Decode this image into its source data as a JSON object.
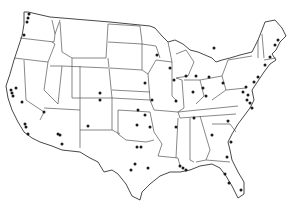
{
  "map": {
    "title": "Contiguous United States locations map",
    "width": 296,
    "height": 209,
    "colors": {
      "background": "#ffffff",
      "border": "#555555",
      "coast": "#333333",
      "dot": "#1a1a1a"
    },
    "dot_radius": 1.5,
    "points": [
      {
        "x": 29,
        "y": 14
      },
      {
        "x": 28,
        "y": 18
      },
      {
        "x": 27,
        "y": 22
      },
      {
        "x": 24,
        "y": 35
      },
      {
        "x": 16,
        "y": 88
      },
      {
        "x": 11,
        "y": 90
      },
      {
        "x": 12,
        "y": 93
      },
      {
        "x": 13,
        "y": 96
      },
      {
        "x": 22,
        "y": 102
      },
      {
        "x": 44,
        "y": 112
      },
      {
        "x": 25,
        "y": 124
      },
      {
        "x": 26,
        "y": 127
      },
      {
        "x": 28,
        "y": 134
      },
      {
        "x": 58,
        "y": 134
      },
      {
        "x": 60,
        "y": 135
      },
      {
        "x": 62,
        "y": 144
      },
      {
        "x": 88,
        "y": 126
      },
      {
        "x": 100,
        "y": 93
      },
      {
        "x": 100,
        "y": 100
      },
      {
        "x": 145,
        "y": 83
      },
      {
        "x": 152,
        "y": 100
      },
      {
        "x": 138,
        "y": 110
      },
      {
        "x": 145,
        "y": 115
      },
      {
        "x": 137,
        "y": 125
      },
      {
        "x": 137,
        "y": 147
      },
      {
        "x": 141,
        "y": 147
      },
      {
        "x": 135,
        "y": 164
      },
      {
        "x": 131,
        "y": 170
      },
      {
        "x": 148,
        "y": 168
      },
      {
        "x": 157,
        "y": 55
      },
      {
        "x": 170,
        "y": 68
      },
      {
        "x": 174,
        "y": 80
      },
      {
        "x": 150,
        "y": 127
      },
      {
        "x": 176,
        "y": 101
      },
      {
        "x": 186,
        "y": 76
      },
      {
        "x": 196,
        "y": 76
      },
      {
        "x": 209,
        "y": 77
      },
      {
        "x": 193,
        "y": 92
      },
      {
        "x": 203,
        "y": 88
      },
      {
        "x": 206,
        "y": 96
      },
      {
        "x": 223,
        "y": 83
      },
      {
        "x": 214,
        "y": 48
      },
      {
        "x": 194,
        "y": 118
      },
      {
        "x": 176,
        "y": 127
      },
      {
        "x": 228,
        "y": 121
      },
      {
        "x": 212,
        "y": 135
      },
      {
        "x": 180,
        "y": 166
      },
      {
        "x": 183,
        "y": 168
      },
      {
        "x": 186,
        "y": 170
      },
      {
        "x": 231,
        "y": 142
      },
      {
        "x": 227,
        "y": 157
      },
      {
        "x": 225,
        "y": 174
      },
      {
        "x": 229,
        "y": 183
      },
      {
        "x": 241,
        "y": 190
      },
      {
        "x": 243,
        "y": 92
      },
      {
        "x": 246,
        "y": 87
      },
      {
        "x": 248,
        "y": 95
      },
      {
        "x": 247,
        "y": 100
      },
      {
        "x": 250,
        "y": 103
      },
      {
        "x": 252,
        "y": 108
      },
      {
        "x": 254,
        "y": 82
      },
      {
        "x": 258,
        "y": 77
      },
      {
        "x": 265,
        "y": 65
      },
      {
        "x": 270,
        "y": 57
      },
      {
        "x": 275,
        "y": 45
      },
      {
        "x": 278,
        "y": 40
      }
    ]
  }
}
